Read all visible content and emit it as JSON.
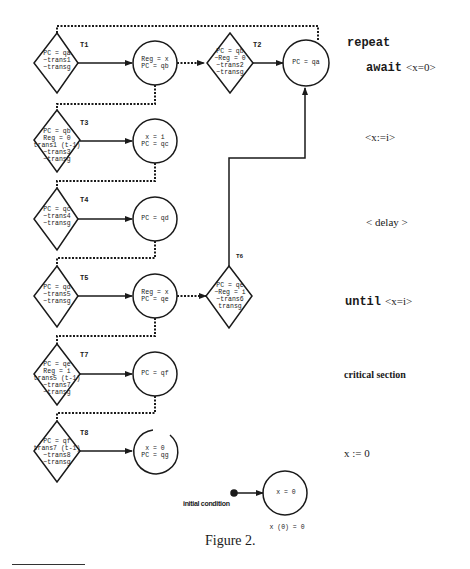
{
  "figure": {
    "caption": "Figure 2.",
    "program": {
      "repeat": "repeat",
      "await_kw": "await",
      "await_cond": "<x=0>",
      "assign_xi": "<x:=i>",
      "delay": "< delay >",
      "until_kw": "until",
      "until_cond": "<x=i>",
      "critical": "critical section",
      "reset": "x := 0"
    },
    "initial": {
      "label": "initial condition",
      "state": "x = 0",
      "note": "x (0) = 0"
    },
    "transitions": [
      {
        "id": "T1",
        "lines": [
          "PC = qa",
          "~trans1",
          "~transg"
        ]
      },
      {
        "id": "T2",
        "lines": [
          "PC = qb",
          "~Reg = 0",
          "~trans2",
          "~transg"
        ]
      },
      {
        "id": "T3",
        "lines": [
          "PC = qb",
          "Reg = 0",
          "trans1 (t-1)",
          "~trans3",
          "~transg"
        ]
      },
      {
        "id": "T4",
        "lines": [
          "PC = qc",
          "~trans4",
          "~transg"
        ]
      },
      {
        "id": "T5",
        "lines": [
          "PC = qd",
          "~trans5",
          "~transg"
        ]
      },
      {
        "id": "T6",
        "lines": [
          "PC = qe",
          "~Reg = i",
          "~trans6",
          "transg"
        ]
      },
      {
        "id": "T7",
        "lines": [
          "PC = qe",
          "Reg = i",
          "trans5 (t-1)",
          "~trans7",
          "~transg"
        ]
      },
      {
        "id": "T8",
        "lines": [
          "PC = qf",
          "trans7 (t-1)",
          "~trans8",
          "~transg"
        ]
      }
    ],
    "states": [
      {
        "id": "qa",
        "lines": [
          "PC = qa"
        ]
      },
      {
        "id": "qb",
        "lines": [
          "Reg = x",
          "PC = qb"
        ]
      },
      {
        "id": "qc",
        "lines": [
          "x = i",
          "PC = qc"
        ]
      },
      {
        "id": "qd",
        "lines": [
          "PC = qd"
        ]
      },
      {
        "id": "qe",
        "lines": [
          "Reg = x",
          "PC = qe"
        ]
      },
      {
        "id": "qf",
        "lines": [
          "PC = qf"
        ]
      },
      {
        "id": "qg",
        "lines": [
          "x = 0",
          "PC = qg"
        ]
      }
    ]
  }
}
